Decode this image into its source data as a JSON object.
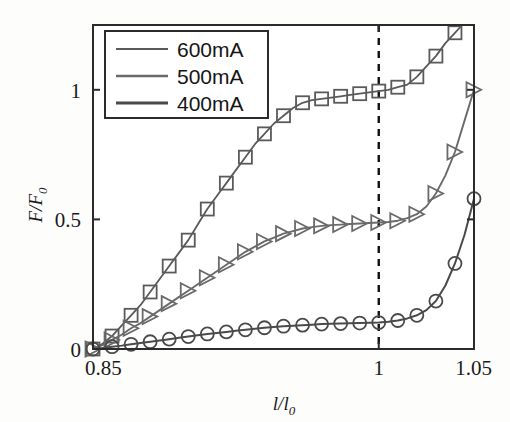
{
  "chart_data": {
    "type": "line",
    "title": "",
    "xlabel": "l/l0",
    "ylabel": "F/F0",
    "xlabel_parts": {
      "main": "l/l",
      "sub": "0"
    },
    "ylabel_parts": {
      "main": "F/F",
      "sub": "0"
    },
    "xlim": [
      0.85,
      1.05
    ],
    "ylim": [
      0,
      1.25
    ],
    "xticks": [
      0.85,
      1,
      1.05
    ],
    "xtick_labels": [
      "0.85",
      "1",
      "1.05"
    ],
    "yticks": [
      0,
      0.5,
      1
    ],
    "ytick_labels": [
      "0",
      "0.5",
      "1"
    ],
    "grid": false,
    "legend_position": "top-left",
    "annotations": [
      {
        "name": "reference-line",
        "type": "vertical-dashed",
        "x": 1.0,
        "label": ""
      }
    ],
    "series": [
      {
        "name": "600mA",
        "marker": "square",
        "color": "#5a5a5a",
        "line_width": 1.8,
        "x": [
          0.85,
          0.855,
          0.86,
          0.865,
          0.87,
          0.875,
          0.88,
          0.885,
          0.89,
          0.895,
          0.9,
          0.905,
          0.91,
          0.915,
          0.92,
          0.925,
          0.93,
          0.935,
          0.94,
          0.945,
          0.95,
          0.955,
          0.96,
          0.965,
          0.97,
          0.975,
          0.98,
          0.985,
          0.99,
          0.995,
          1.0,
          1.005,
          1.01,
          1.015,
          1.02,
          1.025,
          1.03,
          1.035,
          1.04,
          1.045
        ],
        "y": [
          0.0,
          0.02,
          0.05,
          0.09,
          0.13,
          0.17,
          0.22,
          0.27,
          0.32,
          0.37,
          0.42,
          0.48,
          0.54,
          0.59,
          0.64,
          0.69,
          0.74,
          0.79,
          0.83,
          0.87,
          0.9,
          0.93,
          0.95,
          0.96,
          0.965,
          0.97,
          0.975,
          0.98,
          0.985,
          0.99,
          0.995,
          1.0,
          1.01,
          1.02,
          1.05,
          1.09,
          1.13,
          1.18,
          1.22,
          1.26
        ],
        "marker_x": [
          0.85,
          0.86,
          0.87,
          0.88,
          0.89,
          0.9,
          0.91,
          0.92,
          0.93,
          0.94,
          0.95,
          0.96,
          0.97,
          0.98,
          0.99,
          1.0,
          1.01,
          1.02,
          1.03,
          1.04
        ],
        "marker_y": [
          0.0,
          0.05,
          0.13,
          0.22,
          0.32,
          0.42,
          0.54,
          0.64,
          0.74,
          0.83,
          0.9,
          0.95,
          0.965,
          0.975,
          0.985,
          0.995,
          1.01,
          1.05,
          1.13,
          1.22
        ]
      },
      {
        "name": "500mA",
        "marker": "triangle",
        "color": "#6a6a6a",
        "line_width": 1.9,
        "x": [
          0.85,
          0.855,
          0.86,
          0.865,
          0.87,
          0.875,
          0.88,
          0.885,
          0.89,
          0.895,
          0.9,
          0.905,
          0.91,
          0.915,
          0.92,
          0.925,
          0.93,
          0.935,
          0.94,
          0.945,
          0.95,
          0.955,
          0.96,
          0.965,
          0.97,
          0.975,
          0.98,
          0.985,
          0.99,
          0.995,
          1.0,
          1.005,
          1.01,
          1.015,
          1.02,
          1.025,
          1.03,
          1.035,
          1.04,
          1.045,
          1.05
        ],
        "y": [
          0.0,
          0.015,
          0.035,
          0.055,
          0.08,
          0.1,
          0.125,
          0.15,
          0.175,
          0.2,
          0.225,
          0.25,
          0.275,
          0.3,
          0.325,
          0.35,
          0.375,
          0.395,
          0.415,
          0.43,
          0.445,
          0.455,
          0.465,
          0.47,
          0.475,
          0.478,
          0.48,
          0.482,
          0.484,
          0.486,
          0.488,
          0.49,
          0.495,
          0.505,
          0.52,
          0.55,
          0.6,
          0.67,
          0.76,
          0.88,
          1.0
        ],
        "marker_x": [
          0.85,
          0.86,
          0.87,
          0.88,
          0.89,
          0.9,
          0.91,
          0.92,
          0.93,
          0.94,
          0.95,
          0.96,
          0.97,
          0.98,
          0.99,
          1.0,
          1.01,
          1.02,
          1.03,
          1.04,
          1.05
        ],
        "marker_y": [
          0.0,
          0.035,
          0.08,
          0.125,
          0.175,
          0.225,
          0.275,
          0.325,
          0.375,
          0.415,
          0.445,
          0.465,
          0.475,
          0.48,
          0.484,
          0.488,
          0.495,
          0.52,
          0.6,
          0.76,
          1.0
        ]
      },
      {
        "name": "400mA",
        "marker": "circle",
        "color": "#4a4a4a",
        "line_width": 2.0,
        "x": [
          0.85,
          0.855,
          0.86,
          0.865,
          0.87,
          0.875,
          0.88,
          0.885,
          0.89,
          0.895,
          0.9,
          0.905,
          0.91,
          0.915,
          0.92,
          0.925,
          0.93,
          0.935,
          0.94,
          0.945,
          0.95,
          0.955,
          0.96,
          0.965,
          0.97,
          0.975,
          0.98,
          0.985,
          0.99,
          0.995,
          1.0,
          1.005,
          1.01,
          1.015,
          1.02,
          1.025,
          1.03,
          1.035,
          1.04,
          1.045,
          1.05
        ],
        "y": [
          0.0,
          0.004,
          0.009,
          0.013,
          0.018,
          0.023,
          0.028,
          0.033,
          0.038,
          0.043,
          0.048,
          0.053,
          0.058,
          0.062,
          0.066,
          0.07,
          0.074,
          0.078,
          0.082,
          0.085,
          0.088,
          0.09,
          0.092,
          0.094,
          0.096,
          0.097,
          0.098,
          0.099,
          0.1,
          0.101,
          0.102,
          0.105,
          0.11,
          0.118,
          0.13,
          0.15,
          0.185,
          0.245,
          0.33,
          0.44,
          0.58
        ],
        "marker_x": [
          0.85,
          0.86,
          0.87,
          0.88,
          0.89,
          0.9,
          0.91,
          0.92,
          0.93,
          0.94,
          0.95,
          0.96,
          0.97,
          0.98,
          0.99,
          1.0,
          1.01,
          1.02,
          1.03,
          1.04,
          1.05
        ],
        "marker_y": [
          0.0,
          0.009,
          0.018,
          0.028,
          0.038,
          0.048,
          0.058,
          0.066,
          0.074,
          0.082,
          0.088,
          0.092,
          0.096,
          0.098,
          0.1,
          0.102,
          0.11,
          0.13,
          0.185,
          0.33,
          0.58
        ]
      }
    ],
    "legend_entries": [
      {
        "label": "600mA",
        "color": "#5a5a5a",
        "line_width": 2.0
      },
      {
        "label": "500mA",
        "color": "#6a6a6a",
        "line_width": 2.4
      },
      {
        "label": "400mA",
        "color": "#4a4a4a",
        "line_width": 2.8
      }
    ]
  }
}
